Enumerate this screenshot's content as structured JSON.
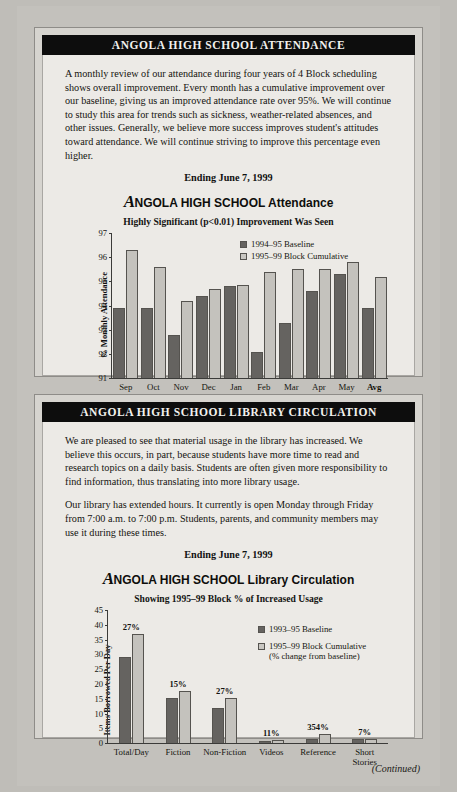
{
  "attendance": {
    "header": "ANGOLA HIGH SCHOOL ATTENDANCE",
    "paragraph": "A monthly review of our attendance during four years of 4 Block scheduling shows overall improvement. Every month has a cumulative improvement over our baseline, giving us an improved attendance rate over 95%. We will continue to study this area for trends such as sickness, weather-related absences, and other issues. Generally, we believe more success improves student's attitudes toward attendance. We will continue striving to improve this percentage even higher.",
    "ending": "Ending June 7, 1999",
    "title_a": "A",
    "title_rest": "NGOLA HIGH SCHOOL Attendance",
    "subtitle": "Highly Significant (p<0.01) Improvement Was Seen",
    "legend": [
      "1994–95 Baseline",
      "1995–99 Block Cumulative"
    ]
  },
  "library": {
    "header": "ANGOLA HIGH SCHOOL LIBRARY CIRCULATION",
    "paragraph1": "We are pleased to see that material usage in the library has increased. We believe this occurs, in part, because students have more time to read and research topics on a daily basis. Students are often given more responsibility to find information, thus translating into more library usage.",
    "paragraph2": "Our library has extended hours. It currently is open Monday through Friday from 7:00 a.m. to 7:00 p.m. Students, parents, and community members may use it during these times.",
    "ending": "Ending June 7, 1999",
    "title_a": "A",
    "title_rest": "NGOLA HIGH SCHOOL Library Circulation",
    "subtitle": "Showing 1995–99 Block % of Increased Usage",
    "legend": [
      "1993–95 Baseline",
      "1995–99 Block Cumulative",
      "(% change from baseline)"
    ]
  },
  "footer": "(Continued)",
  "chart_data": [
    {
      "type": "bar",
      "id": "attendance",
      "title": "ANGOLA HIGH SCHOOL Attendance",
      "subtitle": "Highly Significant (p<0.01) Improvement Was Seen",
      "xlabel": "",
      "ylabel": "% Monthly Attendance",
      "ylim": [
        91,
        97
      ],
      "yticks": [
        97,
        96,
        95,
        94,
        93,
        92,
        91
      ],
      "grid": false,
      "legend_position": "top-center",
      "categories": [
        "Sep",
        "Oct",
        "Nov",
        "Dec",
        "Jan",
        "Feb",
        "Mar",
        "Apr",
        "May",
        "Avg"
      ],
      "series": [
        {
          "name": "1994–95 Baseline",
          "color": "#656360",
          "values": [
            93.9,
            93.9,
            92.8,
            94.4,
            94.8,
            92.1,
            93.3,
            94.6,
            95.3,
            93.9
          ]
        },
        {
          "name": "1995–99 Block Cumulative",
          "color": "#c4c2bd",
          "values": [
            96.3,
            95.6,
            94.2,
            94.7,
            94.85,
            95.4,
            95.5,
            95.5,
            95.8,
            95.2
          ]
        }
      ]
    },
    {
      "type": "bar",
      "id": "library",
      "title": "ANGOLA HIGH SCHOOL Library Circulation",
      "subtitle": "Showing 1995–99 Block % of Increased Usage",
      "xlabel": "",
      "ylabel": "Items Borrowed Per Day",
      "ylim": [
        0,
        45
      ],
      "yticks": [
        45,
        40,
        35,
        30,
        25,
        20,
        15,
        10,
        5,
        0
      ],
      "grid": false,
      "legend_position": "right",
      "categories": [
        "Total/Day",
        "Fiction",
        "Non-Fiction",
        "Videos",
        "Reference",
        "Short Stories"
      ],
      "annotations": [
        "27%",
        "15%",
        "27%",
        "11%",
        "354%",
        "7%"
      ],
      "series": [
        {
          "name": "1993–95 Baseline",
          "color": "#656360",
          "values": [
            29,
            15.3,
            12,
            0.9,
            1.3,
            1.4
          ]
        },
        {
          "name": "1995–99 Block Cumulative",
          "color": "#c4c2bd",
          "values": [
            37,
            17.7,
            15.2,
            1.0,
            3.0,
            1.5
          ]
        }
      ]
    }
  ]
}
